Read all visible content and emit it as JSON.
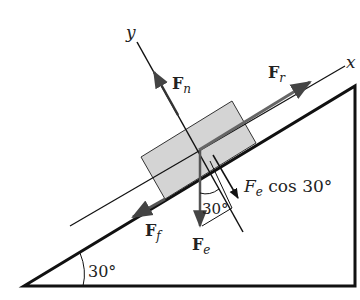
{
  "diagram": {
    "axes": {
      "x_label": "x",
      "y_label": "y"
    },
    "forces": {
      "normal": {
        "symbol": "F",
        "sub": "n"
      },
      "applied": {
        "symbol": "F",
        "sub": "r"
      },
      "friction": {
        "symbol": "F",
        "sub": "f"
      },
      "weight": {
        "symbol": "F",
        "sub": "e"
      },
      "weight_component": {
        "symbol": "F",
        "sub": "e",
        "suffix": " cos 30°"
      }
    },
    "angles": {
      "incline": "30°",
      "weight_angle": "30°"
    },
    "colors": {
      "block_fill": "#d4d4d4",
      "arrow": "#555555",
      "line": "#111111"
    }
  }
}
